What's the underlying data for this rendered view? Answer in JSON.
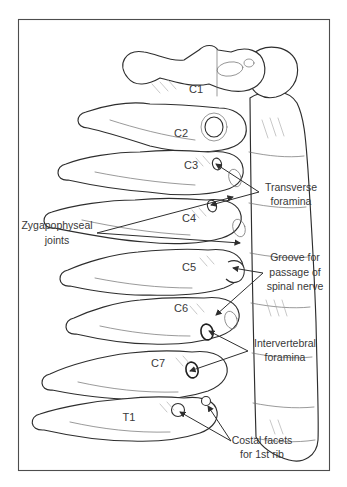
{
  "figure": {
    "type": "anatomical-line-diagram",
    "vertebrae": [
      "C1",
      "C2",
      "C3",
      "C4",
      "C5",
      "C6",
      "C7",
      "T1"
    ],
    "annotations": [
      {
        "id": "transverse-foramina",
        "lines": [
          "Transverse",
          "foramina"
        ]
      },
      {
        "id": "zygapophyseal-joints",
        "lines": [
          "Zygapophyseal",
          "joints"
        ]
      },
      {
        "id": "groove-spinal-nerve",
        "lines": [
          "Groove for",
          "passage of",
          "spinal nerve"
        ]
      },
      {
        "id": "intervertebral-foramina",
        "lines": [
          "Intervertebral",
          "foramina"
        ]
      },
      {
        "id": "costal-facets",
        "lines": [
          "Costal facets",
          "for 1st rib"
        ]
      }
    ],
    "colors": {
      "ink": "#2e2e2e",
      "paper": "#ffffff",
      "frame": "#4d4d4d",
      "text": "#383838"
    }
  }
}
